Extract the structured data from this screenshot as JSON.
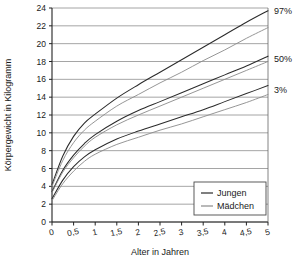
{
  "chart_data": {
    "type": "line",
    "title": "",
    "xlabel": "Alter in Jahren",
    "ylabel": "Körpergewicht in Kilogramm",
    "xlim": [
      0,
      5
    ],
    "ylim": [
      0,
      24
    ],
    "grid": true,
    "x_ticks": [
      "0",
      "0,5",
      "1",
      "1,5",
      "2",
      "2,5",
      "3",
      "3,5",
      "4",
      "4,5",
      "5"
    ],
    "x_tick_values": [
      0,
      0.5,
      1,
      1.5,
      2,
      2.5,
      3,
      3.5,
      4,
      4.5,
      5
    ],
    "y_ticks": [
      "0",
      "2",
      "4",
      "6",
      "8",
      "10",
      "12",
      "14",
      "16",
      "18",
      "20",
      "22",
      "24"
    ],
    "y_tick_values": [
      0,
      2,
      4,
      6,
      8,
      10,
      12,
      14,
      16,
      18,
      20,
      22,
      24
    ],
    "legend_position": "bottom-right",
    "legend": [
      {
        "name": "Jungen",
        "color": "#2b2b2b"
      },
      {
        "name": "Mädchen",
        "color": "#8a8a8a"
      }
    ],
    "annotations": [
      {
        "text": "97%",
        "x": 5,
        "y": 23.7
      },
      {
        "text": "50%",
        "x": 5,
        "y": 18.3
      },
      {
        "text": "3%",
        "x": 5,
        "y": 14.8
      }
    ],
    "x": [
      0,
      0.25,
      0.5,
      0.75,
      1,
      1.5,
      2,
      2.5,
      3,
      3.5,
      4,
      4.5,
      5
    ],
    "series": [
      {
        "name": "Jungen 97%",
        "group": "Jungen",
        "percentile": "97%",
        "color": "#2b2b2b",
        "values": [
          4.2,
          7.4,
          9.6,
          11.1,
          12.1,
          13.9,
          15.4,
          16.8,
          18.2,
          19.6,
          21.0,
          22.4,
          23.7
        ]
      },
      {
        "name": "Mädchen 97%",
        "group": "Mädchen",
        "percentile": "97%",
        "color": "#8a8a8a",
        "values": [
          4.0,
          6.9,
          8.9,
          10.3,
          11.3,
          13.0,
          14.3,
          15.6,
          16.8,
          18.1,
          19.3,
          20.6,
          21.8
        ]
      },
      {
        "name": "Jungen 50%",
        "group": "Jungen",
        "percentile": "50%",
        "color": "#2b2b2b",
        "values": [
          3.4,
          5.8,
          7.5,
          8.8,
          9.8,
          11.3,
          12.5,
          13.5,
          14.5,
          15.5,
          16.5,
          17.5,
          18.6
        ]
      },
      {
        "name": "Mädchen 50%",
        "group": "Mädchen",
        "percentile": "50%",
        "color": "#8a8a8a",
        "values": [
          3.3,
          5.6,
          7.2,
          8.5,
          9.5,
          10.9,
          12.0,
          13.0,
          14.0,
          15.0,
          16.0,
          17.0,
          18.0
        ]
      },
      {
        "name": "Jungen 3%",
        "group": "Jungen",
        "percentile": "3%",
        "color": "#2b2b2b",
        "values": [
          2.6,
          4.7,
          6.2,
          7.3,
          8.1,
          9.3,
          10.2,
          11.0,
          11.8,
          12.6,
          13.5,
          14.4,
          15.3
        ]
      },
      {
        "name": "Mädchen 3%",
        "group": "Mädchen",
        "percentile": "3%",
        "color": "#8a8a8a",
        "values": [
          2.4,
          4.3,
          5.7,
          6.8,
          7.6,
          8.7,
          9.5,
          10.3,
          11.0,
          11.8,
          12.6,
          13.4,
          14.3
        ]
      }
    ]
  }
}
